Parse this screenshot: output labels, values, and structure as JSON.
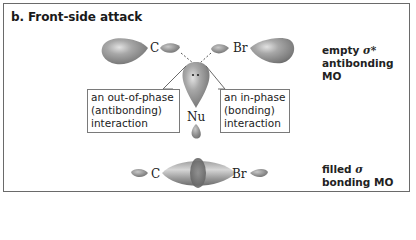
{
  "title": "b. Front-side attack",
  "top_mo": {
    "atoms": {
      "left": "C",
      "right": "Br",
      "nucleophile": "Nu"
    },
    "label_line1_prefix": "empty ",
    "label_symbol": "σ*",
    "label_line2": "antibonding MO"
  },
  "callouts": {
    "out_of_phase": {
      "line1": "an out-of-phase",
      "line2": "(antibonding)",
      "line3": "interaction"
    },
    "in_phase": {
      "line1": "an in-phase",
      "line2": "(bonding)",
      "line3": "interaction"
    }
  },
  "bottom_mo": {
    "atoms": {
      "left": "C",
      "right": "Br"
    },
    "label_line1_prefix": "filled ",
    "label_symbol": "σ",
    "label_line2": "bonding MO"
  },
  "colors": {
    "orbital": "#8f8f8f",
    "orbital_dark": "#5f5f5f",
    "orbital_light": "#d0d0d0",
    "frame": "#6a6a6a",
    "text": "#222222"
  }
}
